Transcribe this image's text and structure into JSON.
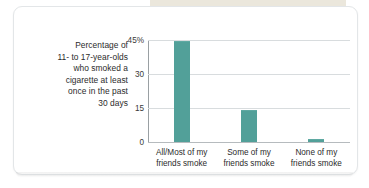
{
  "card": {
    "background_color": "#ffffff",
    "border_color": "#e3e6e8",
    "top_strip_color": "#e8e3d6"
  },
  "chart_data": {
    "type": "bar",
    "title": "",
    "subtitle": "",
    "xlabel": "",
    "ylabel": "Percentage of 11- to 17-year-olds who smoked a cigarette at least once in the past 30 days",
    "ylabel_lines": [
      "Percentage of",
      "11- to 17-year-olds",
      "who smoked a",
      "cigarette at least",
      "once in the past",
      "30 days"
    ],
    "categories": [
      "All/Most of my friends smoke",
      "Some of my friends smoke",
      "None of my friends smoke"
    ],
    "category_lines": [
      [
        "All/Most of my",
        "friends smoke"
      ],
      [
        "Some of my",
        "friends smoke"
      ],
      [
        "None of my",
        "friends smoke"
      ]
    ],
    "values": [
      44,
      13.5,
      1
    ],
    "ylim": [
      0,
      45
    ],
    "yticks": [
      0,
      15,
      30,
      45
    ],
    "ytick_labels": [
      "0",
      "15",
      "30",
      "45%"
    ],
    "grid": true,
    "legend": false,
    "bar_color": "#52a099",
    "gridline_color": "#d8dcde",
    "axis_color": "#9aa0a3"
  }
}
